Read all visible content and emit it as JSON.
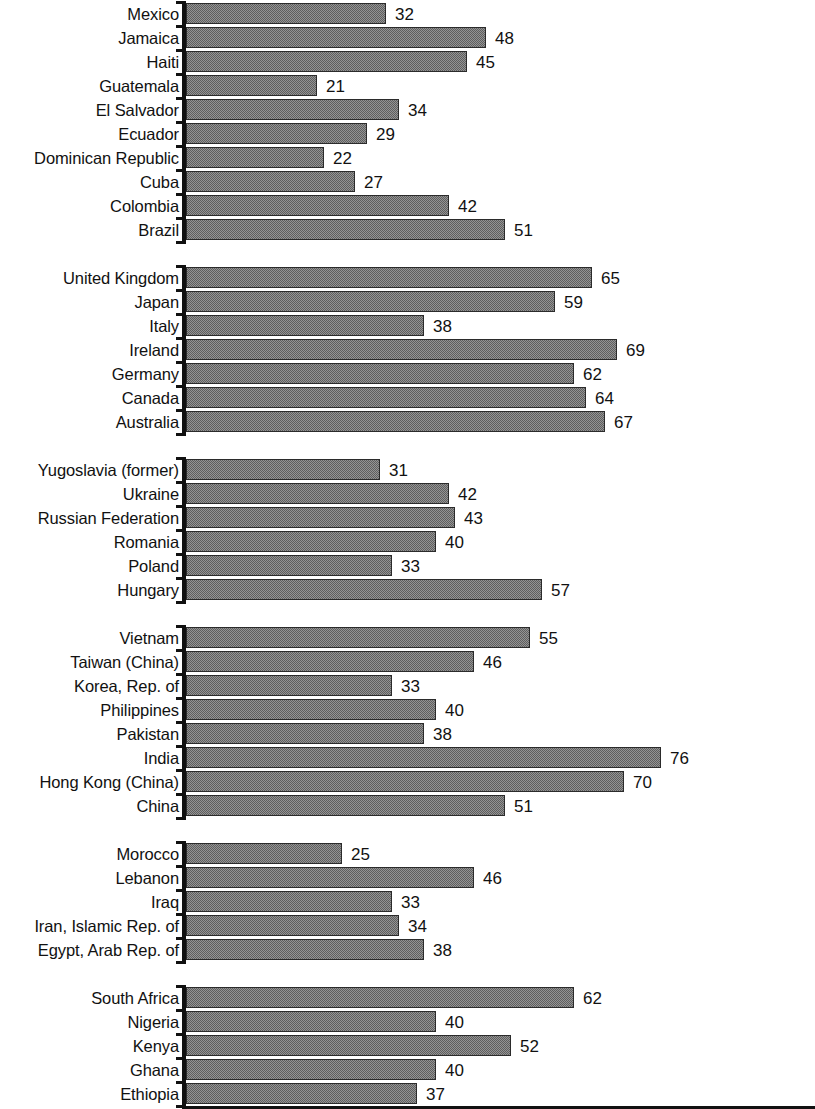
{
  "chart_data": {
    "type": "bar",
    "orientation": "horizontal",
    "title": "",
    "subtitle": "",
    "xlabel": "",
    "ylabel": "",
    "xlim": [
      0,
      100
    ],
    "grid": false,
    "legend": null,
    "value_labels": true,
    "bar_color": "#949494",
    "bar_border_color": "#2b2b2b",
    "axis_color": "#111111",
    "background_color": "#ffffff",
    "groups": [
      {
        "name": "latin-america-caribbean",
        "categories": [
          "Mexico",
          "Jamaica",
          "Haiti",
          "Guatemala",
          "El Salvador",
          "Ecuador",
          "Dominican Republic",
          "Cuba",
          "Colombia",
          "Brazil"
        ],
        "values": [
          32,
          48,
          45,
          21,
          34,
          29,
          22,
          27,
          42,
          51
        ]
      },
      {
        "name": "high-income",
        "categories": [
          "United Kingdom",
          "Japan",
          "Italy",
          "Ireland",
          "Germany",
          "Canada",
          "Australia"
        ],
        "values": [
          65,
          59,
          38,
          69,
          62,
          64,
          67
        ]
      },
      {
        "name": "eastern-europe-central-asia",
        "categories": [
          "Yugoslavia (former)",
          "Ukraine",
          "Russian Federation",
          "Romania",
          "Poland",
          "Hungary"
        ],
        "values": [
          31,
          42,
          43,
          40,
          33,
          57
        ]
      },
      {
        "name": "asia",
        "categories": [
          "Vietnam",
          "Taiwan (China)",
          "Korea, Rep. of",
          "Philippines",
          "Pakistan",
          "India",
          "Hong Kong (China)",
          "China"
        ],
        "values": [
          55,
          46,
          33,
          40,
          38,
          76,
          70,
          51
        ]
      },
      {
        "name": "middle-east-north-africa",
        "categories": [
          "Morocco",
          "Lebanon",
          "Iraq",
          "Iran, Islamic Rep. of",
          "Egypt, Arab Rep. of"
        ],
        "values": [
          25,
          46,
          33,
          34,
          38
        ]
      },
      {
        "name": "sub-saharan-africa",
        "categories": [
          "South Africa",
          "Nigeria",
          "Kenya",
          "Ghana",
          "Ethiopia"
        ],
        "values": [
          62,
          40,
          52,
          40,
          37
        ]
      }
    ]
  }
}
